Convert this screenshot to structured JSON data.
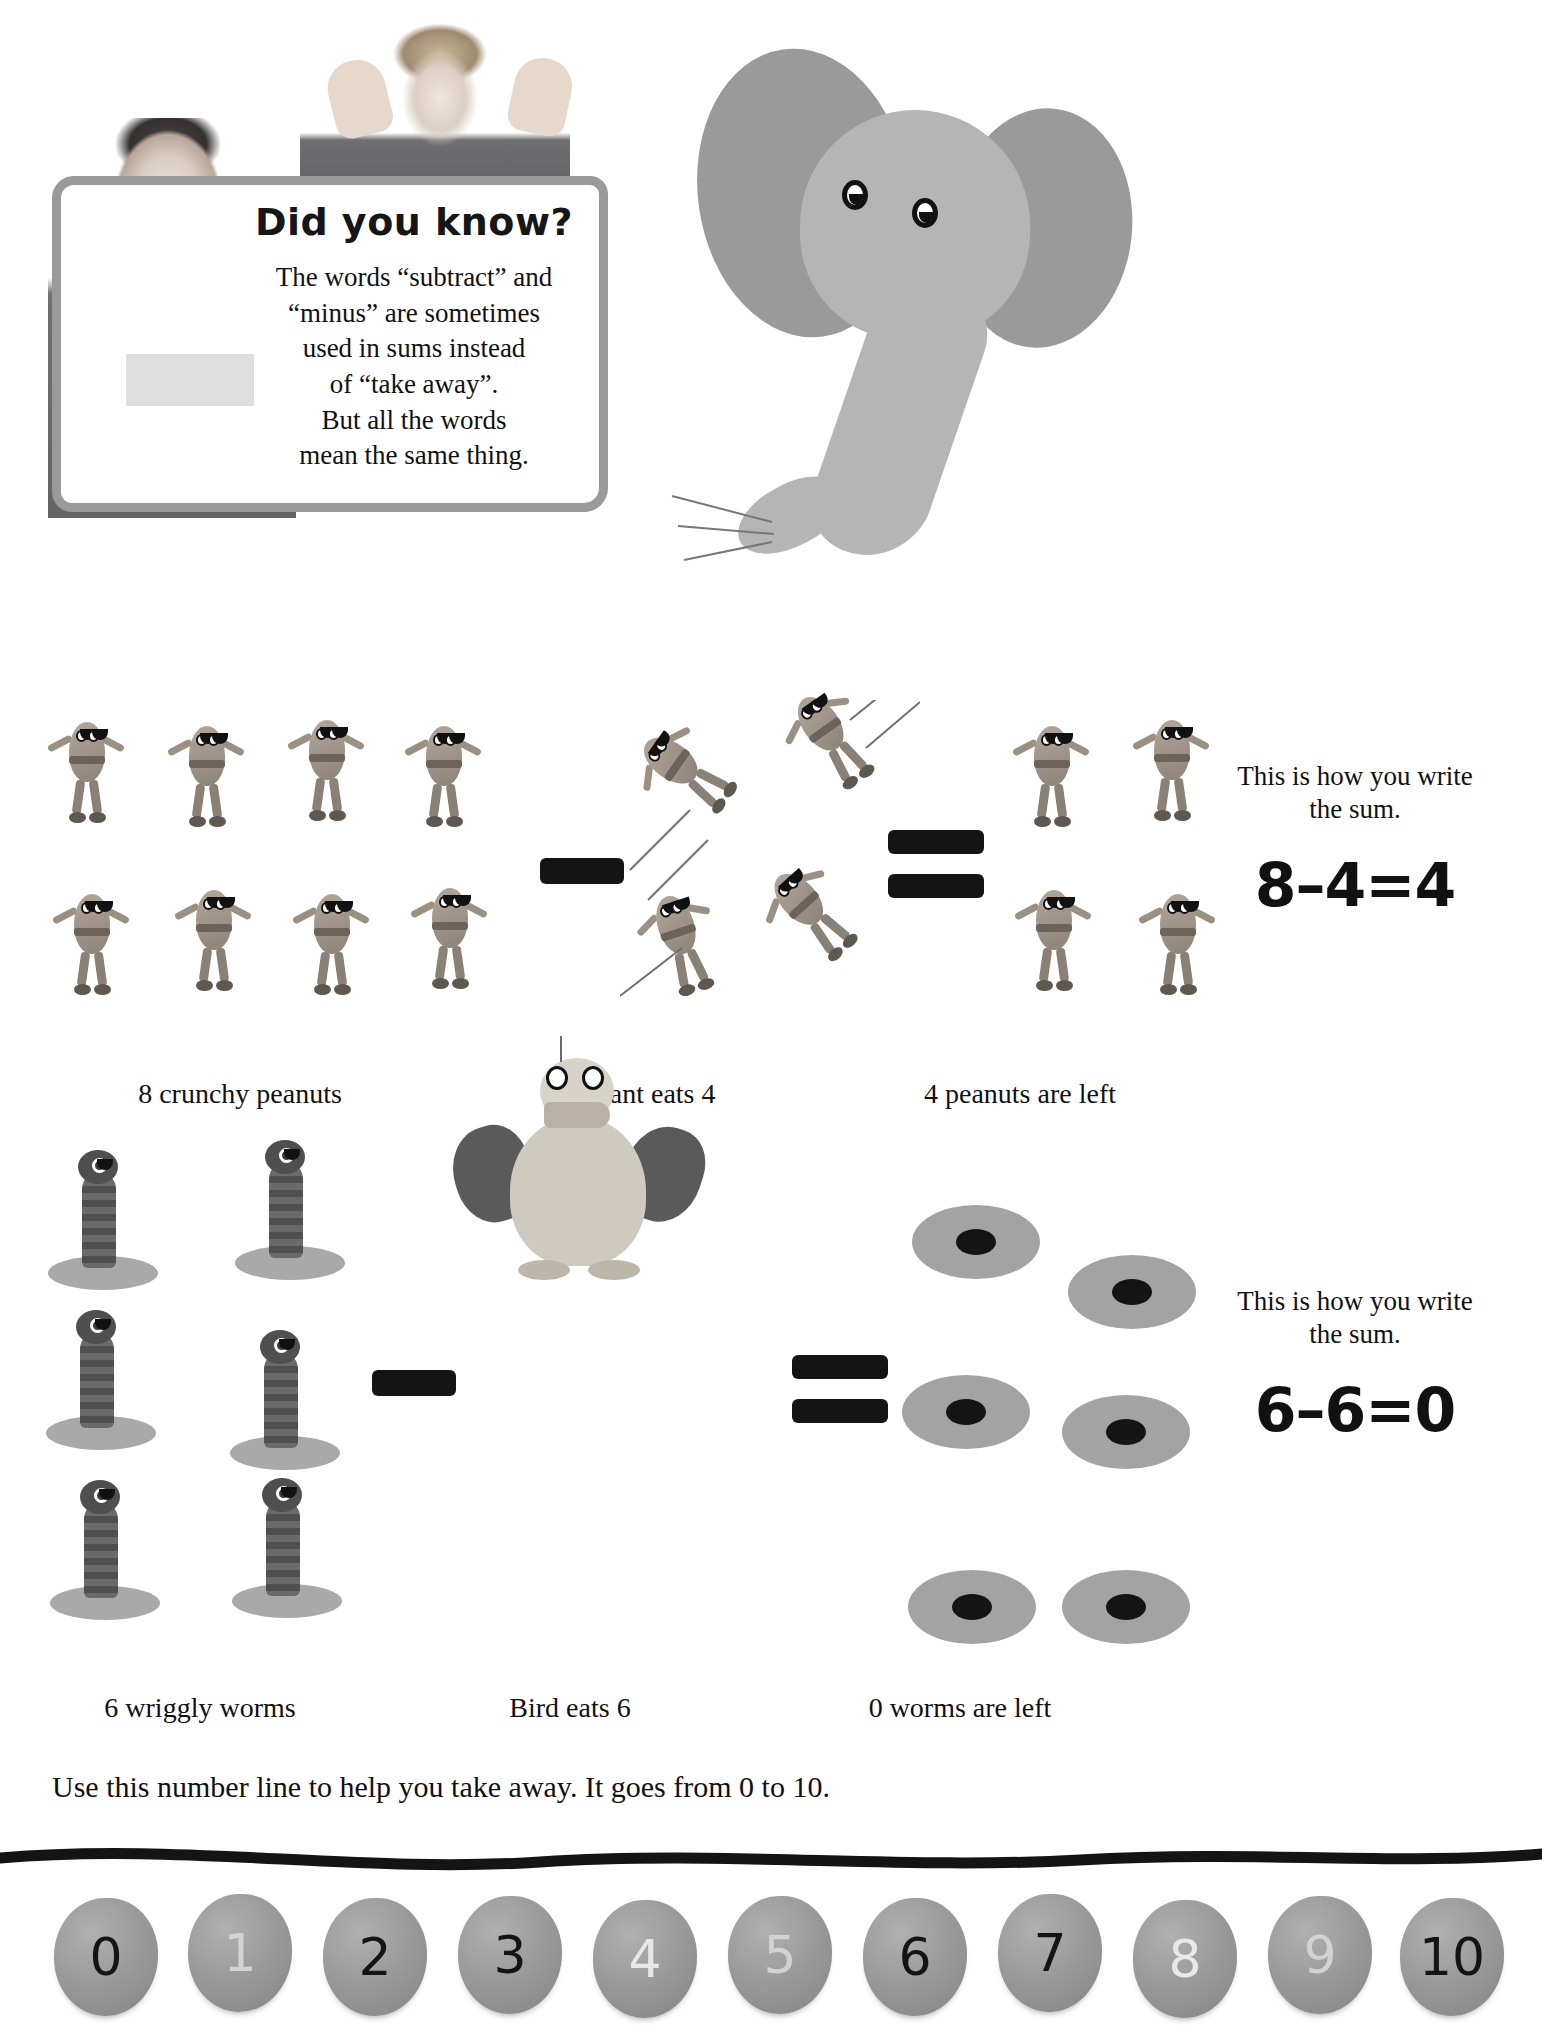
{
  "info_panel": {
    "title": "Did you know?",
    "body_lines": [
      "The words “subtract” and",
      "“minus” are sometimes",
      "used in sums instead",
      "of “take away”.",
      "But all the words",
      "mean the same thing."
    ]
  },
  "sections": [
    {
      "id": "peanuts",
      "left_caption": "8 crunchy peanuts",
      "middle_caption": "Elephant eats 4",
      "right_caption": "4 peanuts are left",
      "sum_note": "This is how you write the sum.",
      "equation": "8–4=4",
      "minuend": 8,
      "subtrahend": 4,
      "result": 4
    },
    {
      "id": "worms",
      "left_caption": "6 wriggly worms",
      "middle_caption": "Bird eats 6",
      "right_caption": "0 worms are left",
      "sum_note": "This is how you write the sum.",
      "equation": "6–6=0",
      "minuend": 6,
      "subtrahend": 6,
      "result": 0
    }
  ],
  "number_line": {
    "instruction": "Use this number line to help you take away. It goes from 0 to 10.",
    "range_start": 0,
    "range_end": 10,
    "stones": [
      {
        "label": "0",
        "ink": "dark"
      },
      {
        "label": "1",
        "ink": "mid"
      },
      {
        "label": "2",
        "ink": "dark"
      },
      {
        "label": "3",
        "ink": "dark"
      },
      {
        "label": "4",
        "ink": "light"
      },
      {
        "label": "5",
        "ink": "mid"
      },
      {
        "label": "6",
        "ink": "dark"
      },
      {
        "label": "7",
        "ink": "dark"
      },
      {
        "label": "8",
        "ink": "light"
      },
      {
        "label": "9",
        "ink": "mid"
      },
      {
        "label": "10",
        "ink": "dark"
      }
    ]
  },
  "colors": {
    "panel_border": "#9a9a9a",
    "elephant": "#b5b5b5",
    "elephant_ear": "#9a9a9a",
    "ink": "#141414",
    "stone": "#9b9b9b",
    "plate": "#a3a3a3"
  }
}
